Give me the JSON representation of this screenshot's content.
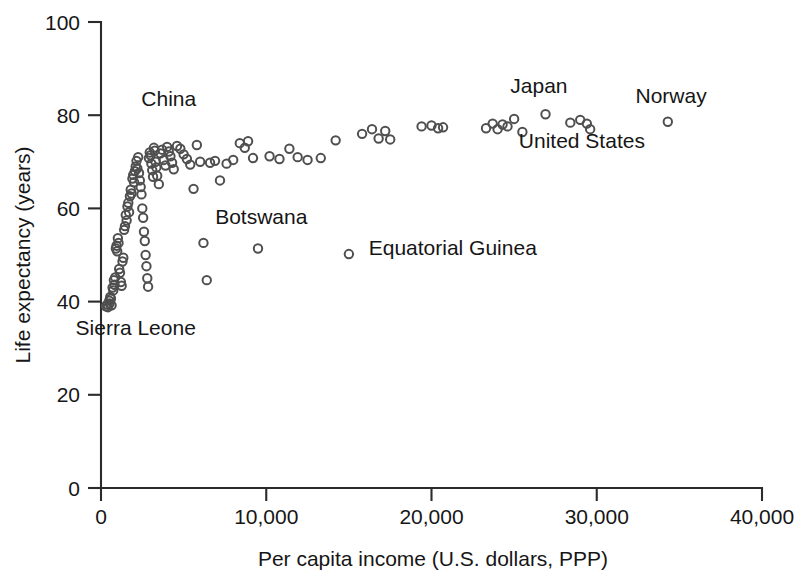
{
  "chart_data": {
    "type": "scatter",
    "title": "",
    "xlabel": "Per capita income (U.S. dollars, PPP)",
    "ylabel": "Life expectancy (years)",
    "xlim": [
      0,
      40000
    ],
    "ylim": [
      0,
      100
    ],
    "xticks": [
      0,
      10000,
      20000,
      30000,
      40000
    ],
    "xticklabels": [
      "0",
      "10,000",
      "20,000",
      "30,000",
      "40,000"
    ],
    "yticks": [
      0,
      20,
      40,
      60,
      80,
      100
    ],
    "yticklabels": [
      "0",
      "20",
      "40",
      "60",
      "80",
      "100"
    ],
    "grid": false,
    "legend": null,
    "marker": "open-circle",
    "marker_color": "#4f4f4f",
    "series": [
      {
        "name": "Countries",
        "points": [
          [
            300,
            39.0
          ],
          [
            380,
            39.4
          ],
          [
            420,
            38.8
          ],
          [
            500,
            40.2
          ],
          [
            520,
            39.6
          ],
          [
            560,
            41.0
          ],
          [
            600,
            40.6
          ],
          [
            640,
            39.2
          ],
          [
            700,
            43.0
          ],
          [
            740,
            42.4
          ],
          [
            780,
            44.6
          ],
          [
            820,
            43.6
          ],
          [
            860,
            45.2
          ],
          [
            900,
            51.4
          ],
          [
            940,
            52.0
          ],
          [
            980,
            50.8
          ],
          [
            1020,
            53.6
          ],
          [
            1060,
            52.6
          ],
          [
            1100,
            47.0
          ],
          [
            1150,
            46.2
          ],
          [
            1200,
            44.2
          ],
          [
            1250,
            43.4
          ],
          [
            1300,
            48.6
          ],
          [
            1350,
            49.4
          ],
          [
            1400,
            55.4
          ],
          [
            1450,
            56.2
          ],
          [
            1500,
            58.6
          ],
          [
            1550,
            57.4
          ],
          [
            1600,
            60.4
          ],
          [
            1650,
            61.2
          ],
          [
            1700,
            59.2
          ],
          [
            1750,
            62.6
          ],
          [
            1800,
            64.0
          ],
          [
            1850,
            63.2
          ],
          [
            1900,
            66.4
          ],
          [
            1950,
            67.2
          ],
          [
            2000,
            65.6
          ],
          [
            2050,
            68.0
          ],
          [
            2100,
            69.0
          ],
          [
            2150,
            70.2
          ],
          [
            2200,
            68.6
          ],
          [
            2250,
            71.0
          ],
          [
            2300,
            67.6
          ],
          [
            2350,
            66.0
          ],
          [
            2400,
            64.6
          ],
          [
            2450,
            63.0
          ],
          [
            2500,
            60.0
          ],
          [
            2550,
            58.0
          ],
          [
            2600,
            55.0
          ],
          [
            2650,
            53.0
          ],
          [
            2700,
            50.0
          ],
          [
            2750,
            47.6
          ],
          [
            2800,
            45.0
          ],
          [
            2850,
            43.2
          ],
          [
            2900,
            70.8
          ],
          [
            2950,
            72.0
          ],
          [
            3000,
            71.4
          ],
          [
            3050,
            69.6
          ],
          [
            3100,
            68.2
          ],
          [
            3150,
            66.8
          ],
          [
            3200,
            73.0
          ],
          [
            3250,
            72.4
          ],
          [
            3300,
            70.0
          ],
          [
            3350,
            68.8
          ],
          [
            3400,
            67.0
          ],
          [
            3500,
            65.2
          ],
          [
            3600,
            71.8
          ],
          [
            3700,
            72.6
          ],
          [
            3800,
            70.4
          ],
          [
            3900,
            69.2
          ],
          [
            4000,
            73.2
          ],
          [
            4100,
            72.2
          ],
          [
            4200,
            71.2
          ],
          [
            4300,
            69.8
          ],
          [
            4400,
            68.4
          ],
          [
            4600,
            73.4
          ],
          [
            4800,
            72.8
          ],
          [
            5000,
            71.6
          ],
          [
            5200,
            70.6
          ],
          [
            5400,
            69.4
          ],
          [
            5600,
            64.2
          ],
          [
            5800,
            73.6
          ],
          [
            6000,
            70.0
          ],
          [
            6200,
            52.6
          ],
          [
            6400,
            44.6
          ],
          [
            6600,
            69.8
          ],
          [
            6900,
            70.2
          ],
          [
            7200,
            66.0
          ],
          [
            7600,
            69.6
          ],
          [
            8000,
            70.4
          ],
          [
            8400,
            74.0
          ],
          [
            8700,
            73.0
          ],
          [
            8900,
            74.4
          ],
          [
            9200,
            70.8
          ],
          [
            9500,
            51.4
          ],
          [
            10200,
            71.2
          ],
          [
            10800,
            70.6
          ],
          [
            11400,
            72.8
          ],
          [
            11900,
            71.0
          ],
          [
            12500,
            70.4
          ],
          [
            13300,
            70.8
          ],
          [
            14200,
            74.6
          ],
          [
            15000,
            50.2
          ],
          [
            15800,
            76.0
          ],
          [
            16400,
            77.0
          ],
          [
            16800,
            75.0
          ],
          [
            17200,
            76.6
          ],
          [
            17500,
            74.8
          ],
          [
            19400,
            77.6
          ],
          [
            20000,
            77.8
          ],
          [
            20400,
            77.2
          ],
          [
            20700,
            77.4
          ],
          [
            23300,
            77.2
          ],
          [
            23700,
            78.2
          ],
          [
            24000,
            77.0
          ],
          [
            24300,
            78.0
          ],
          [
            24600,
            77.6
          ],
          [
            25000,
            79.2
          ],
          [
            25500,
            76.4
          ],
          [
            26900,
            80.2
          ],
          [
            28400,
            78.4
          ],
          [
            29000,
            79.0
          ],
          [
            29400,
            78.2
          ],
          [
            29600,
            77.0
          ],
          [
            34300,
            78.6
          ]
        ]
      }
    ],
    "annotations": [
      {
        "label": "China",
        "x": 4100,
        "y": 82.0,
        "anchor": "middle"
      },
      {
        "label": "Sierra Leone",
        "x": 2100,
        "y": 32.8,
        "anchor": "middle"
      },
      {
        "label": "Botswana",
        "x": 9700,
        "y": 56.6,
        "anchor": "middle"
      },
      {
        "label": "Equatorial Guinea",
        "x": 16200,
        "y": 50.0,
        "anchor": "start"
      },
      {
        "label": "Japan",
        "x": 26500,
        "y": 84.8,
        "anchor": "middle"
      },
      {
        "label": "Norway",
        "x": 34500,
        "y": 82.6,
        "anchor": "middle"
      },
      {
        "label": "United States",
        "x": 29100,
        "y": 73.0,
        "anchor": "middle"
      }
    ]
  }
}
